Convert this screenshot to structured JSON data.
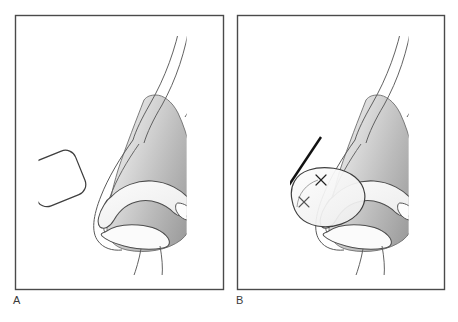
{
  "figure": {
    "kind": "medical-illustration",
    "panel_count": 2,
    "background_color": "#ffffff",
    "frame_color": "#4a4a4a",
    "outline_color": "#404040",
    "skin_gradient_light": "#e2e2e2",
    "skin_gradient_dark": "#9d9d9d",
    "cartilage_fill": "#fbfbfb",
    "graft_fill": "#ffffff",
    "arrow_color": "#111111",
    "suture_color": "#222222"
  },
  "panels": [
    {
      "id": "panel-a",
      "label": "A",
      "caption_label": "A",
      "frame": {
        "x": 15,
        "y": 15,
        "width": 209,
        "height": 275
      },
      "description": "Nasal profile with lower lateral cartilage exposed and a rounded rectangular cartilage graft held to the left, not yet placed.",
      "elements": {
        "nose": "nasal-profile-outline",
        "tip": "shaded-nasal-tip",
        "cartilage": "lower-lateral-cartilage",
        "lobule": "alar-lobule",
        "graft": "cartilage-graft-unplaced",
        "columella_lines": 2,
        "dorsum_lines": 3
      },
      "graft": {
        "name": "cartilage-graft",
        "shape": "rounded-rectangle",
        "rotation_degrees": -22,
        "placed": false
      },
      "arrow": null,
      "sutures": []
    },
    {
      "id": "panel-b",
      "label": "B",
      "caption_label": "B",
      "frame": {
        "x": 237,
        "y": 15,
        "width": 208,
        "height": 275
      },
      "description": "Same nasal profile with the cartilage graft seated over the tip and secured with sutures; arrow indicates the direction of caudal advancement.",
      "elements": {
        "nose": "nasal-profile-outline",
        "tip": "shaded-nasal-tip",
        "cartilage": "lower-lateral-cartilage",
        "lobule": "alar-lobule",
        "graft": "cartilage-graft-placed",
        "columella_lines": 2,
        "dorsum_lines": 3
      },
      "graft": {
        "name": "cartilage-graft",
        "shape": "rounded-rectangle-overlay",
        "rotation_degrees": -18,
        "placed": true
      },
      "arrow": {
        "name": "direction-arrow",
        "from": {
          "x": 321,
          "y": 137
        },
        "to": {
          "x": 271,
          "y": 212
        },
        "direction": "caudal-inferior-left",
        "style": "solid-filled-head"
      },
      "sutures": [
        {
          "name": "suture-mark-upper",
          "x": 321,
          "y": 180,
          "glyph": "x"
        },
        {
          "name": "suture-mark-lower",
          "x": 304,
          "y": 202,
          "glyph": "x"
        }
      ]
    }
  ]
}
